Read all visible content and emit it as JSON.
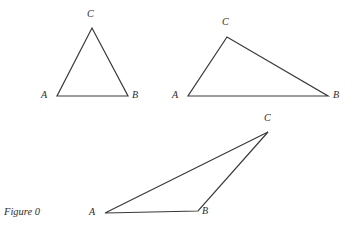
{
  "figure": {
    "caption": "Figure 0",
    "caption_position": {
      "x": 4,
      "y": 206
    },
    "background_color": "#ffffff",
    "stroke_color": "#3a3a3a",
    "label_color": "#2b2b2b",
    "stroke_width": 1.2,
    "canvas": {
      "width": 354,
      "height": 241
    },
    "shapes": [
      {
        "name": "triangle-1",
        "description": "tall narrow acute triangle, apex C at top center",
        "vertices": [
          {
            "label": "A",
            "x": 57,
            "y": 96,
            "label_x": 41,
            "label_y": 90
          },
          {
            "label": "B",
            "x": 128,
            "y": 96,
            "label_x": 132,
            "label_y": 90
          },
          {
            "label": "C",
            "x": 92,
            "y": 28,
            "label_x": 87,
            "label_y": 9
          }
        ]
      },
      {
        "name": "triangle-2",
        "description": "obtuse triangle, apex C upper-left, long base A to B",
        "vertices": [
          {
            "label": "A",
            "x": 188,
            "y": 96,
            "label_x": 172,
            "label_y": 90
          },
          {
            "label": "B",
            "x": 328,
            "y": 96,
            "label_x": 333,
            "label_y": 90
          },
          {
            "label": "C",
            "x": 227,
            "y": 37,
            "label_x": 222,
            "label_y": 17
          }
        ]
      },
      {
        "name": "triangle-3",
        "description": "very obtuse thin triangle, apex C far upper-right, short base A to B",
        "vertices": [
          {
            "label": "A",
            "x": 105,
            "y": 213,
            "label_x": 89,
            "label_y": 207
          },
          {
            "label": "B",
            "x": 198,
            "y": 211,
            "label_x": 202,
            "label_y": 206
          },
          {
            "label": "C",
            "x": 268,
            "y": 132,
            "label_x": 264,
            "label_y": 113
          }
        ]
      }
    ]
  }
}
